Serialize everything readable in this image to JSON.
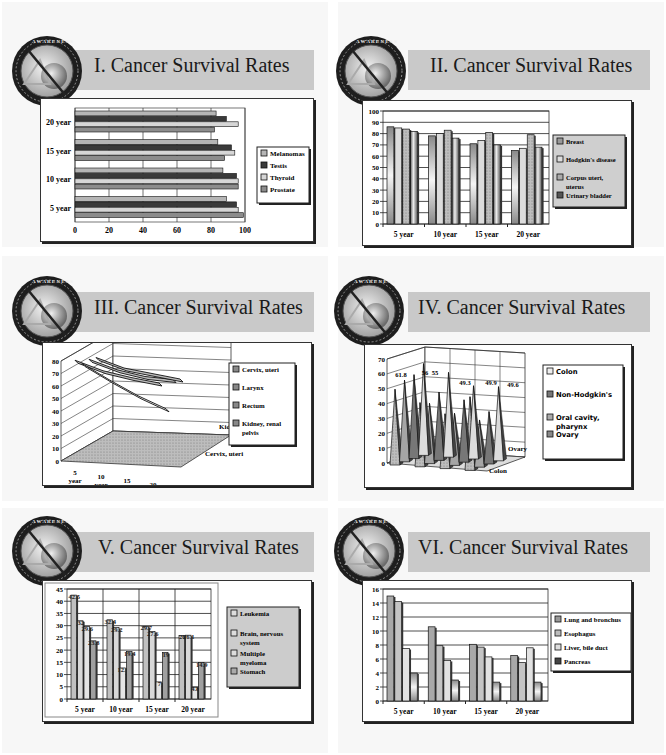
{
  "page": {
    "background": "#ffffff"
  },
  "slides": [
    {
      "title": "I. Cancer Survival Rates",
      "badge": "information-awareness-office-seal"
    },
    {
      "title": "II. Cancer Survival Rates",
      "badge": "information-awareness-office-seal"
    },
    {
      "title": "III. Cancer Survival Rates",
      "badge": "information-awareness-office-seal"
    },
    {
      "title": "IV. Cancer Survival Rates",
      "badge": "information-awareness-office-seal"
    },
    {
      "title": "V. Cancer Survival Rates",
      "badge": "information-awareness-office-seal"
    },
    {
      "title": "VI. Cancer Survival Rates",
      "badge": "information-awareness-office-seal"
    }
  ],
  "chart_data": [
    {
      "type": "bar",
      "orientation": "horizontal",
      "title": "I. Cancer Survival Rates",
      "categories": [
        "5 year",
        "10 year",
        "15 year",
        "20 year"
      ],
      "series": [
        {
          "name": "Melanomas",
          "values": [
            89,
            87,
            84,
            83
          ],
          "color": "#b5b5b5"
        },
        {
          "name": "Testis",
          "values": [
            95,
            95,
            92,
            89
          ],
          "color": "#3a3a3a"
        },
        {
          "name": "Thyroid",
          "values": [
            96,
            96,
            94,
            96
          ],
          "color": "#d6d6d6"
        },
        {
          "name": "Prostate",
          "values": [
            99,
            96,
            88,
            82
          ],
          "color": "#8c8c8c"
        }
      ],
      "xlim": [
        0,
        100
      ],
      "xticks": [
        0,
        20,
        40,
        60,
        80,
        100
      ],
      "grid": true,
      "legend_position": "right"
    },
    {
      "type": "bar",
      "title": "II. Cancer Survival Rates",
      "categories": [
        "5 year",
        "10 year",
        "15 year",
        "20 year"
      ],
      "series": [
        {
          "name": "Breast",
          "values": [
            86,
            78,
            71,
            65
          ],
          "color": "#a8a8a8"
        },
        {
          "name": "Hodgkin's disease",
          "values": [
            85,
            80,
            74,
            67
          ],
          "color": "#d8d8d8"
        },
        {
          "name": "Corpus uteri, uterus",
          "values": [
            84,
            83,
            81,
            79
          ],
          "color": "#9a9a9a"
        },
        {
          "name": "Urinary bladder",
          "values": [
            82,
            76,
            70,
            68
          ],
          "color": "#4a4a4a"
        }
      ],
      "ylim": [
        0,
        100
      ],
      "yticks": [
        0,
        10,
        20,
        30,
        40,
        50,
        60,
        70,
        80,
        90,
        100
      ],
      "grid": true,
      "legend_position": "right"
    },
    {
      "type": "line",
      "style": "3d-ribbon",
      "title": "III. Cancer Survival Rates",
      "categories": [
        "5 year",
        "10 year",
        "15 year",
        "20 year"
      ],
      "depth_labels": [
        "Cervix, uteri",
        "Kidney, renal pelvis"
      ],
      "series": [
        {
          "name": "Cervix, uteri",
          "values": [
            71,
            65,
            62,
            60
          ]
        },
        {
          "name": "Larynx",
          "values": [
            66,
            55,
            45,
            37
          ]
        },
        {
          "name": "Rectum",
          "values": [
            67,
            61,
            58,
            58
          ]
        },
        {
          "name": "Kidney, renal pelvis",
          "values": [
            66,
            60,
            58,
            56
          ]
        }
      ],
      "ylim": [
        0,
        80
      ],
      "yticks": [
        0,
        10,
        20,
        30,
        40,
        50,
        60,
        70,
        80
      ],
      "grid": true,
      "legend_position": "right"
    },
    {
      "type": "bar",
      "style": "3d-pyramid",
      "title": "IV. Cancer Survival Rates",
      "categories": [
        "5 year",
        "10 year",
        "15 year",
        "20 year"
      ],
      "depth_labels": [
        "Colon",
        "Ovary"
      ],
      "series": [
        {
          "name": "Colon",
          "values": [
            61.8,
            57.1,
            49.3,
            49.9
          ]
        },
        {
          "name": "Non-Hodgkin's",
          "values": [
            56.5,
            46.0,
            42.0,
            35.3
          ]
        },
        {
          "name": "Oral cavity, pharynx",
          "values": [
            55.0,
            40.6,
            35.1,
            31.8
          ]
        },
        {
          "name": "Ovary",
          "values": [
            51.0,
            43.2,
            36.9,
            49.6
          ]
        }
      ],
      "data_labels": [
        "61.8",
        "56",
        "55",
        "49.3",
        "49.9",
        "49.6"
      ],
      "ylim": [
        0,
        70
      ],
      "yticks": [
        0,
        10,
        20,
        30,
        40,
        50,
        60,
        70
      ],
      "grid": true,
      "legend_position": "right"
    },
    {
      "type": "bar",
      "title": "V. Cancer Survival Rates",
      "categories": [
        "5 year",
        "10 year",
        "15 year",
        "20 year"
      ],
      "series": [
        {
          "name": "Leukemia",
          "values": [
            42.5,
            32.4,
            29.7,
            26.0
          ],
          "color": "#c0c0c0"
        },
        {
          "name": "Brain, nervous system",
          "values": [
            32,
            29.2,
            27.6,
            26.1
          ],
          "color": "#d8d8d8"
        },
        {
          "name": "Multiple myeloma",
          "values": [
            29.6,
            12.7,
            7,
            4.8
          ],
          "color": "#e4e4e4"
        },
        {
          "name": "Stomach",
          "values": [
            23.8,
            19.4,
            19,
            14.9
          ],
          "color": "#a0a0a0"
        }
      ],
      "data_labels": [
        [
          "42.5",
          "32",
          "29.6",
          "23.8"
        ],
        [
          "32.4",
          "29.2",
          "12.7",
          "19.4"
        ],
        [
          "29.7",
          "27.6",
          "7",
          "19"
        ],
        [
          "26",
          "26.1",
          "4.8",
          "14.9"
        ]
      ],
      "ylim": [
        0,
        45
      ],
      "yticks": [
        0,
        5,
        10,
        15,
        20,
        25,
        30,
        35,
        40,
        45
      ],
      "grid": true,
      "legend_position": "right"
    },
    {
      "type": "bar",
      "title": "VI. Cancer Survival Rates",
      "categories": [
        "5 year",
        "10 year",
        "15 year",
        "20 year"
      ],
      "series": [
        {
          "name": "Lung and bronchus",
          "values": [
            15.0,
            10.6,
            8.1,
            6.5
          ],
          "color": "#a8a8a8"
        },
        {
          "name": "Esophagus",
          "values": [
            14.2,
            7.9,
            7.7,
            5.5
          ],
          "color": "#c4c4c4"
        },
        {
          "name": "Liver, bile duct",
          "values": [
            7.5,
            5.8,
            6.3,
            7.6
          ],
          "color": "#e2e2e2"
        },
        {
          "name": "Pancreas",
          "values": [
            4.0,
            3.0,
            2.7,
            2.7
          ],
          "color": "#505050"
        }
      ],
      "ylim": [
        0,
        16
      ],
      "yticks": [
        0,
        2,
        4,
        6,
        8,
        10,
        12,
        14,
        16
      ],
      "grid": true,
      "legend_position": "right"
    }
  ]
}
